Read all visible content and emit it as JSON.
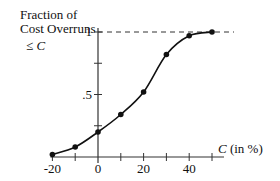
{
  "chart_data": {
    "type": "line",
    "title": "",
    "ylabel_lines": [
      "Fraction of",
      "Cost Overruns"
    ],
    "ylabel_leq": "≤",
    "ylabel_var": "C",
    "xlabel_var": "C",
    "xlabel_unit": " (in %)",
    "x": [
      -20,
      -10,
      0,
      10,
      20,
      30,
      40,
      50
    ],
    "series": [
      {
        "name": "Fraction of Cost Overruns ≤ C",
        "values": [
          0.02,
          0.08,
          0.2,
          0.34,
          0.52,
          0.82,
          0.97,
          1.0
        ]
      }
    ],
    "xlim": [
      -20,
      50
    ],
    "ylim": [
      0,
      1
    ],
    "x_ticks": [
      -20,
      -10,
      0,
      10,
      20,
      30,
      40,
      50
    ],
    "x_tick_labels": [
      {
        "value": -20,
        "label": "-20"
      },
      {
        "value": 0,
        "label": "0"
      },
      {
        "value": 20,
        "label": "20"
      },
      {
        "value": 40,
        "label": "40"
      }
    ],
    "y_ticks": [
      0.25,
      0.5,
      0.75,
      1
    ],
    "y_tick_labels": [
      {
        "value": 0.5,
        "label": ".5"
      },
      {
        "value": 1,
        "label": "1"
      }
    ],
    "reference_line": {
      "y": 1,
      "style": "dashed"
    },
    "grid": false,
    "legend": "none"
  }
}
